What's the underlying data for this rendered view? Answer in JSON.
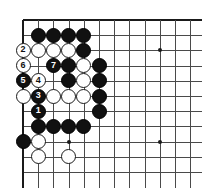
{
  "figure": {
    "kind": "go-board-diagram",
    "board": {
      "columns": 12,
      "rows": 11,
      "cell_size": 15.2,
      "origin_x": 23,
      "origin_y": 20,
      "line_color": "#4a4a4a",
      "edge_color": "#1a1a1a",
      "background_color": "#ffffff",
      "top_edge": true,
      "left_edge": true
    },
    "star_points": [
      {
        "col": 3,
        "row": 8
      },
      {
        "col": 9,
        "row": 2
      },
      {
        "col": 9,
        "row": 8
      }
    ],
    "stones": [
      {
        "col": 1,
        "row": 1,
        "color": "black",
        "label": ""
      },
      {
        "col": 2,
        "row": 1,
        "color": "black",
        "label": ""
      },
      {
        "col": 3,
        "row": 1,
        "color": "black",
        "label": ""
      },
      {
        "col": 4,
        "row": 1,
        "color": "black",
        "label": ""
      },
      {
        "col": 0,
        "row": 2,
        "color": "white",
        "label": "2"
      },
      {
        "col": 1,
        "row": 2,
        "color": "white",
        "label": ""
      },
      {
        "col": 2,
        "row": 2,
        "color": "white",
        "label": ""
      },
      {
        "col": 3,
        "row": 2,
        "color": "white",
        "label": ""
      },
      {
        "col": 4,
        "row": 2,
        "color": "black",
        "label": ""
      },
      {
        "col": 0,
        "row": 3,
        "color": "white",
        "label": "6"
      },
      {
        "col": 2,
        "row": 3,
        "color": "black",
        "label": "7"
      },
      {
        "col": 3,
        "row": 3,
        "color": "black",
        "label": ""
      },
      {
        "col": 4,
        "row": 3,
        "color": "white",
        "label": ""
      },
      {
        "col": 5,
        "row": 3,
        "color": "black",
        "label": ""
      },
      {
        "col": 0,
        "row": 4,
        "color": "black",
        "label": "5"
      },
      {
        "col": 1,
        "row": 4,
        "color": "white",
        "label": "4"
      },
      {
        "col": 3,
        "row": 4,
        "color": "black",
        "label": ""
      },
      {
        "col": 4,
        "row": 4,
        "color": "white",
        "label": ""
      },
      {
        "col": 5,
        "row": 4,
        "color": "black",
        "label": ""
      },
      {
        "col": 0,
        "row": 5,
        "color": "white",
        "label": ""
      },
      {
        "col": 1,
        "row": 5,
        "color": "black",
        "label": "3"
      },
      {
        "col": 2,
        "row": 5,
        "color": "white",
        "label": ""
      },
      {
        "col": 3,
        "row": 5,
        "color": "white",
        "label": ""
      },
      {
        "col": 4,
        "row": 5,
        "color": "white",
        "label": ""
      },
      {
        "col": 5,
        "row": 5,
        "color": "black",
        "label": ""
      },
      {
        "col": 1,
        "row": 6,
        "color": "black",
        "label": "1"
      },
      {
        "col": 5,
        "row": 6,
        "color": "black",
        "label": ""
      },
      {
        "col": 1,
        "row": 7,
        "color": "black",
        "label": ""
      },
      {
        "col": 2,
        "row": 7,
        "color": "black",
        "label": ""
      },
      {
        "col": 3,
        "row": 7,
        "color": "black",
        "label": ""
      },
      {
        "col": 4,
        "row": 7,
        "color": "black",
        "label": ""
      },
      {
        "col": 0,
        "row": 8,
        "color": "black",
        "label": ""
      },
      {
        "col": 1,
        "row": 8,
        "color": "white",
        "label": ""
      },
      {
        "col": 1,
        "row": 9,
        "color": "white",
        "label": ""
      },
      {
        "col": 3,
        "row": 9,
        "color": "white",
        "label": ""
      }
    ],
    "move_sequence": [
      {
        "number": "1",
        "color": "black"
      },
      {
        "number": "2",
        "color": "white"
      },
      {
        "number": "3",
        "color": "black"
      },
      {
        "number": "4",
        "color": "white"
      },
      {
        "number": "5",
        "color": "black"
      },
      {
        "number": "6",
        "color": "white"
      },
      {
        "number": "7",
        "color": "black"
      }
    ]
  }
}
